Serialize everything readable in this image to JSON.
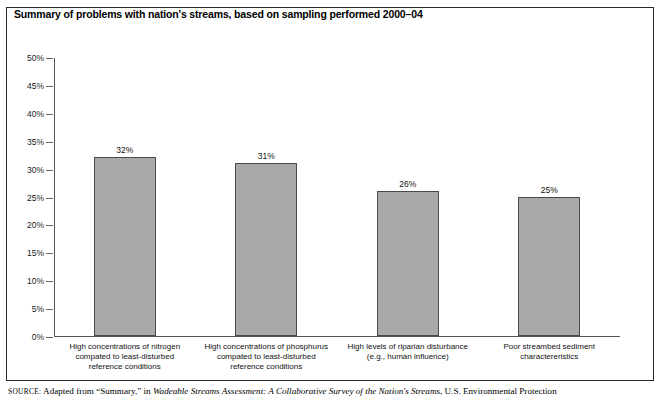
{
  "chart_data": {
    "type": "bar",
    "title": "Summary of problems with nation's streams, based on sampling performed 2000–04",
    "xlabel": "",
    "ylabel": "",
    "ylim": [
      0,
      50
    ],
    "grid": false,
    "legend": null,
    "categories": [
      "High concentrations of nitrogen compated to least-disturbed reference conditions",
      "High concentrations of phosphurus compated to least-disturbed reference conditions",
      "High levels of riparian disturbance (e.g., human influence)",
      "Poor streambed sediment charactereristics"
    ],
    "category_lines": [
      [
        "High concentrations of nitrogen",
        "compated to least-disturbed",
        "reference conditions"
      ],
      [
        "High concentrations of phosphurus",
        "compated to least-disturbed",
        "reference conditions"
      ],
      [
        "High levels of riparian disturbance",
        "(e.g., human influence)"
      ],
      [
        "Poor streambed sediment",
        "charactereristics"
      ]
    ],
    "values": [
      32,
      31,
      26,
      25
    ],
    "value_labels": [
      "32%",
      "31%",
      "26%",
      "25%"
    ],
    "ytick_values": [
      0,
      5,
      10,
      15,
      20,
      25,
      30,
      35,
      40,
      45,
      50
    ],
    "ytick_labels": [
      "0%",
      "5%",
      "10%",
      "15%",
      "20%",
      "25%",
      "30%",
      "35%",
      "40%",
      "45%",
      "50%"
    ],
    "bar_color": "#a9a9a9",
    "bar_border_color": "#4a4a4a",
    "axis_color": "#555555"
  },
  "source": {
    "prefix": "SOURCE:",
    "line1_a": "Adapted from “Summary,” in ",
    "line1_italic": "Wadeable Streams Assessment: A Collaborative Survey of the Nation's Streams",
    "line1_b": ", U.S. Environmental Protection"
  }
}
